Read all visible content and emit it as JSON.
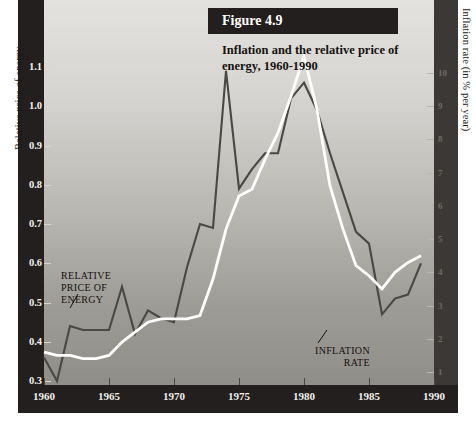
{
  "figure": {
    "badge": "Figure 4.9",
    "title": "Inflation and the relative price of energy, 1960-1990",
    "y_axis_left_title": "Relative price of energy",
    "y_axis_right_title": "Inflation rate (in % per year)",
    "annotation_relative": "RELATIVE\nPRICE OF\nENERGY",
    "annotation_relative_l1": "RELATIVE",
    "annotation_relative_l2": "PRICE OF",
    "annotation_relative_l3": "ENERGY",
    "annotation_inflation_l1": "INFLATION",
    "annotation_inflation_l2": "RATE"
  },
  "colors": {
    "frame": "#231f1e",
    "relative_price_line": "#4a4744",
    "inflation_line": "#ffffff",
    "tick_label_left": "#f2f0ec",
    "tick_label_right": "#6f6a66",
    "plot_top": "#e4e2de",
    "plot_bottom": "#908e89"
  },
  "ticks": {
    "left": [
      "1.1",
      "1.0",
      "0.9",
      "0.8",
      "0.7",
      "0.6",
      "0.5",
      "0.4",
      "0.3"
    ],
    "right": [
      "10",
      "9",
      "8",
      "7",
      "6",
      "5",
      "4",
      "3",
      "2",
      "1"
    ],
    "x": [
      "1960",
      "1965",
      "1970",
      "1975",
      "1980",
      "1985",
      "1990"
    ]
  },
  "chart_data": {
    "type": "line",
    "title": "Inflation and the relative price of energy, 1960-1990",
    "xlabel": "",
    "ylabel": "Relative price of energy",
    "y2label": "Inflation rate (in % per year)",
    "xlim": [
      1960,
      1990
    ],
    "ylim": [
      0.3,
      1.15
    ],
    "y2lim": [
      0,
      10.8
    ],
    "grid": false,
    "legend": "in-plot annotations",
    "x": [
      1960,
      1961,
      1962,
      1963,
      1964,
      1965,
      1966,
      1967,
      1968,
      1969,
      1970,
      1971,
      1972,
      1973,
      1974,
      1975,
      1976,
      1977,
      1978,
      1979,
      1980,
      1981,
      1982,
      1983,
      1984,
      1985,
      1986,
      1987,
      1988,
      1989
    ],
    "series": [
      {
        "name": "RELATIVE PRICE OF ENERGY",
        "axis": "left",
        "color": "#4a4744",
        "values": [
          0.36,
          0.3,
          0.44,
          0.43,
          0.43,
          0.43,
          0.54,
          0.42,
          0.48,
          0.46,
          0.45,
          0.59,
          0.7,
          0.69,
          1.09,
          0.79,
          0.84,
          0.88,
          0.88,
          1.02,
          1.06,
          0.99,
          0.88,
          0.78,
          0.68,
          0.65,
          0.47,
          0.51,
          0.52,
          0.6
        ]
      },
      {
        "name": "INFLATION RATE",
        "axis": "right",
        "color": "#ffffff",
        "values": [
          1.6,
          1.5,
          1.5,
          1.4,
          1.4,
          1.5,
          1.9,
          2.2,
          2.5,
          2.6,
          2.6,
          2.6,
          2.7,
          3.8,
          5.3,
          6.3,
          6.5,
          7.4,
          8.2,
          9.3,
          10.5,
          8.9,
          6.6,
          5.3,
          4.2,
          3.9,
          3.5,
          4.0,
          4.3,
          4.5
        ]
      }
    ]
  }
}
